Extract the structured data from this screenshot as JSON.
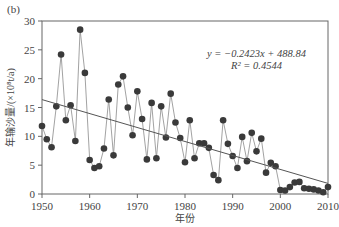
{
  "panel_label": "(b)",
  "chart_data": {
    "type": "line",
    "title": "",
    "xlabel": "年份",
    "ylabel": "年输沙量/(×10⁸t/a)",
    "xlim": [
      1950,
      2010
    ],
    "ylim": [
      0,
      30
    ],
    "xticks": [
      1950,
      1960,
      1970,
      1980,
      1990,
      2000,
      2010
    ],
    "yticks": [
      0,
      5,
      10,
      15,
      20,
      25,
      30
    ],
    "grid": false,
    "legend": null,
    "series": [
      {
        "name": "年输沙量",
        "style": "line+markers",
        "color": "#3a3a3a",
        "x": [
          1950,
          1951,
          1952,
          1953,
          1954,
          1955,
          1956,
          1957,
          1958,
          1959,
          1960,
          1961,
          1962,
          1963,
          1964,
          1965,
          1966,
          1967,
          1968,
          1969,
          1970,
          1971,
          1972,
          1973,
          1974,
          1975,
          1976,
          1977,
          1978,
          1979,
          1980,
          1981,
          1982,
          1983,
          1984,
          1985,
          1986,
          1987,
          1988,
          1989,
          1990,
          1991,
          1992,
          1993,
          1994,
          1995,
          1996,
          1997,
          1998,
          1999,
          2000,
          2001,
          2002,
          2003,
          2004,
          2005,
          2006,
          2007,
          2008,
          2009,
          2010
        ],
        "values": [
          11.8,
          9.5,
          8.1,
          15.2,
          24.2,
          12.8,
          15.4,
          9.2,
          28.5,
          21.0,
          5.9,
          4.5,
          4.8,
          7.9,
          16.4,
          6.7,
          19.0,
          20.4,
          15.0,
          10.2,
          17.8,
          13.0,
          6.0,
          15.8,
          6.2,
          15.2,
          9.8,
          17.4,
          12.4,
          9.7,
          5.5,
          12.8,
          6.2,
          8.8,
          8.8,
          8.0,
          3.3,
          2.4,
          12.8,
          8.7,
          6.6,
          4.5,
          9.9,
          5.7,
          10.6,
          7.4,
          9.6,
          3.7,
          5.4,
          4.8,
          0.7,
          0.6,
          1.2,
          2.0,
          2.1,
          1.0,
          0.9,
          0.8,
          0.6,
          0.3,
          1.2
        ]
      },
      {
        "name": "线性趋势",
        "style": "line",
        "color": "#555555",
        "x": [
          1950,
          2010
        ],
        "values": [
          16.37,
          1.83
        ]
      }
    ],
    "annotations": [
      {
        "text": "y = −0.2423x + 488.84",
        "x": 1995,
        "y": 23.8
      },
      {
        "text": "R² = 0.4544",
        "x": 1995,
        "y": 21.6
      }
    ]
  }
}
